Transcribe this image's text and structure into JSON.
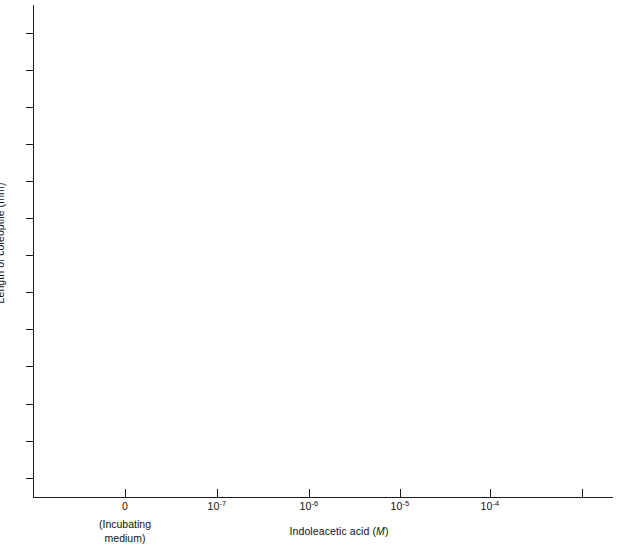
{
  "chart_data": {
    "type": "line",
    "title": "",
    "subtitle": "",
    "xlabel": "Indoleacetic acid (M)",
    "xlabel_plain": "Indoleacetic acid",
    "xlabel_italic_unit": "M",
    "ylabel": "Length of coleoptile (mm)",
    "series": [],
    "values": [],
    "x": [],
    "categories": [],
    "grid": false,
    "legend": false,
    "legend_position": "none",
    "note": "Axes only; no data series plotted in the figure",
    "x_axis": {
      "scale": "log-with-zero-break",
      "tick_positions_px": [
        125,
        217,
        309,
        400,
        490,
        582
      ],
      "tick_labels": [
        {
          "base": "0",
          "exponent": ""
        },
        {
          "base": "10",
          "exponent": "-7"
        },
        {
          "base": "10",
          "exponent": "-6"
        },
        {
          "base": "10",
          "exponent": "-5"
        },
        {
          "base": "10",
          "exponent": "-4"
        },
        {
          "base": "",
          "exponent": ""
        }
      ],
      "zero_tick_note_line1": "(Incubating",
      "zero_tick_note_line2": "medium)"
    },
    "y_axis": {
      "tick_count": 13,
      "tick_labels": [],
      "tick_positions_px": [
        33,
        70,
        107,
        144,
        181,
        218,
        255,
        292,
        329,
        366,
        404,
        441,
        478
      ],
      "ticks_labeled": false,
      "direction": "outward"
    },
    "colors": {
      "axis": "#1a1a1a",
      "text": "#111111",
      "background": "#ffffff"
    }
  }
}
